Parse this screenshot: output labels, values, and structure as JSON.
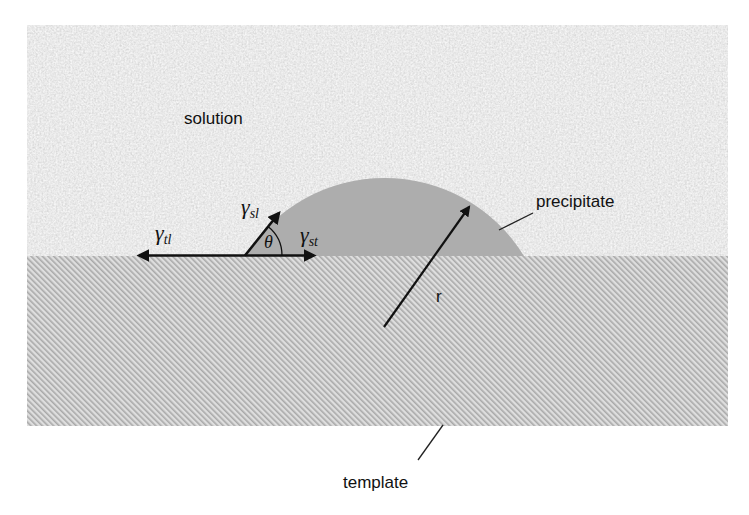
{
  "diagram": {
    "type": "heterogeneous nucleation on template (contact angle schematic)",
    "regions": {
      "solution": {
        "label": "solution",
        "fill": "#e6e6e6",
        "texture": "speckled noise"
      },
      "template": {
        "label": "template",
        "fill": "#d0d0d0",
        "texture": "diagonal hatch",
        "hatch_color": "#a8a8a8"
      },
      "precipitate": {
        "label": "precipitate",
        "fill": "#adadad",
        "shape": "spherical cap"
      }
    },
    "vectors": {
      "gamma_tl": {
        "symbol": "γ",
        "subscript": "tl",
        "direction": "left"
      },
      "gamma_sl": {
        "symbol": "γ",
        "subscript": "sl",
        "direction": "up-right (tangent to cap)"
      },
      "gamma_st": {
        "symbol": "γ",
        "subscript": "st",
        "direction": "right"
      },
      "radius": {
        "label": "r"
      }
    },
    "angle": {
      "symbol": "θ"
    },
    "colors": {
      "line": "#111111",
      "background": "#ffffff"
    }
  }
}
